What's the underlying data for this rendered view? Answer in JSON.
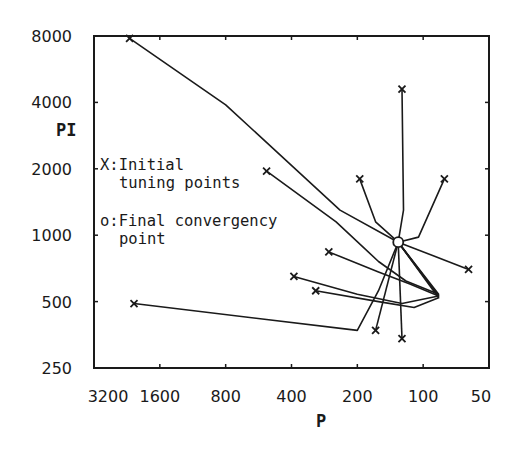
{
  "chart_data": {
    "type": "line",
    "title": "",
    "xlabel": "P",
    "ylabel": "PI",
    "x_scale": "log2 (reversed)",
    "y_scale": "log2",
    "xlim": [
      3200,
      50
    ],
    "ylim": [
      250,
      8000
    ],
    "x_ticks": [
      "3200",
      "1600",
      "800",
      "400",
      "200",
      "100",
      "50"
    ],
    "y_ticks": [
      "8000",
      "4000",
      "2000",
      "1000",
      "500",
      "250"
    ],
    "grid": false,
    "legend": [
      {
        "marker": "x",
        "line1": "X:Initial",
        "line2": "tuning points"
      },
      {
        "marker": "o",
        "line1": "o:Final convergency",
        "line2": "point"
      }
    ],
    "convergence_point": {
      "P": 130,
      "PI": 930
    },
    "series": [
      {
        "name": "run-1",
        "start": {
          "P": 2200,
          "PI": 7800
        },
        "path": [
          [
            2200,
            7800
          ],
          [
            800,
            3900
          ],
          [
            240,
            1300
          ],
          [
            130,
            930
          ]
        ]
      },
      {
        "name": "run-2",
        "start": {
          "P": 520,
          "PI": 1950
        },
        "path": [
          [
            520,
            1950
          ],
          [
            250,
            1150
          ],
          [
            160,
            760
          ],
          [
            120,
            620
          ],
          [
            85,
            540
          ],
          [
            130,
            930
          ]
        ]
      },
      {
        "name": "run-3",
        "start": {
          "P": 125,
          "PI": 4600
        },
        "path": [
          [
            125,
            4600
          ],
          [
            123,
            1300
          ],
          [
            130,
            930
          ]
        ]
      },
      {
        "name": "run-4",
        "start": {
          "P": 195,
          "PI": 1800
        },
        "path": [
          [
            195,
            1800
          ],
          [
            165,
            1150
          ],
          [
            130,
            930
          ]
        ]
      },
      {
        "name": "run-5",
        "start": {
          "P": 80,
          "PI": 1800
        },
        "path": [
          [
            80,
            1800
          ],
          [
            105,
            980
          ],
          [
            130,
            930
          ]
        ]
      },
      {
        "name": "run-6",
        "start": {
          "P": 62,
          "PI": 700
        },
        "path": [
          [
            62,
            700
          ],
          [
            130,
            930
          ]
        ]
      },
      {
        "name": "run-7",
        "start": {
          "P": 270,
          "PI": 840
        },
        "path": [
          [
            270,
            840
          ],
          [
            160,
            680
          ],
          [
            115,
            600
          ],
          [
            85,
            530
          ],
          [
            130,
            930
          ]
        ]
      },
      {
        "name": "run-8",
        "start": {
          "P": 390,
          "PI": 650
        },
        "path": [
          [
            390,
            650
          ],
          [
            200,
            540
          ],
          [
            125,
            490
          ],
          [
            85,
            530
          ],
          [
            130,
            930
          ]
        ]
      },
      {
        "name": "run-9",
        "start": {
          "P": 310,
          "PI": 560
        },
        "path": [
          [
            310,
            560
          ],
          [
            160,
            500
          ],
          [
            110,
            470
          ],
          [
            85,
            520
          ],
          [
            130,
            930
          ]
        ]
      },
      {
        "name": "run-10",
        "start": {
          "P": 2100,
          "PI": 490
        },
        "path": [
          [
            2100,
            490
          ],
          [
            200,
            370
          ],
          [
            160,
            560
          ],
          [
            130,
            930
          ]
        ]
      },
      {
        "name": "run-11",
        "start": {
          "P": 165,
          "PI": 370
        },
        "path": [
          [
            165,
            370
          ],
          [
            130,
            930
          ]
        ]
      },
      {
        "name": "run-12",
        "start": {
          "P": 125,
          "PI": 340
        },
        "path": [
          [
            125,
            340
          ],
          [
            130,
            930
          ]
        ]
      }
    ]
  }
}
